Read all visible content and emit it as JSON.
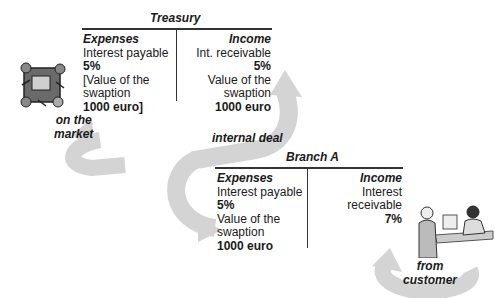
{
  "treasury": {
    "title": "Treasury",
    "expenses": {
      "header": "Expenses",
      "line1": "Interest payable",
      "line2": "5%",
      "line3": "[Value of the",
      "line4": "swaption",
      "line5": "1000 euro]"
    },
    "income": {
      "header": "Income",
      "line1": "Int. receivable",
      "line2": "5%",
      "line3": "Value of the",
      "line4": "swaption",
      "line5": "1000 euro"
    }
  },
  "branch": {
    "title": "Branch A",
    "expenses": {
      "header": "Expenses",
      "line1": "Interest payable",
      "line2": "5%",
      "line3": "Value of the",
      "line4": "swaption",
      "line5": "1000 euro"
    },
    "income": {
      "header": "Income",
      "line1": "Interest",
      "line2": "receivable",
      "line3": "7%"
    }
  },
  "arrows": {
    "market": "on the market",
    "market_l1": "on the",
    "market_l2": "market",
    "internal": "internal deal",
    "customer_l1": "from",
    "customer_l2": "customer"
  },
  "icons": {
    "market_icon": "trading-desk-clipart-icon",
    "customer_icon": "customer-service-clipart-icon"
  },
  "colors": {
    "arrow": "#d4d4d4",
    "line": "#333333"
  }
}
